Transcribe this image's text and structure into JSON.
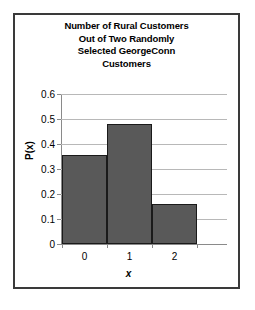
{
  "chart_data": {
    "type": "bar",
    "title": "Number of Rural Customers Out of Two Randomly Selected GeorgeConn Customers",
    "title_lines": [
      "Number of Rural Customers",
      "Out of Two Randomly",
      "Selected GeorgeConn",
      "Customers"
    ],
    "categories": [
      "0",
      "1",
      "2"
    ],
    "values": [
      0.355,
      0.48,
      0.16
    ],
    "xlabel": "x",
    "ylabel": "P(x)",
    "ylim": [
      0,
      0.6
    ],
    "yticks": [
      "0.6",
      "0.5",
      "0.4",
      "0.3",
      "0.2",
      "0.1",
      "0"
    ],
    "ytick_values": [
      0.6,
      0.5,
      0.4,
      0.3,
      0.2,
      0.1,
      0
    ],
    "grid": true,
    "legend": false,
    "bar_color": "#595959",
    "bar_border_color": "#1a1a1a",
    "gridline_color": "#b8b8b8",
    "axis_color": "#8a8a8a",
    "frame_color": "#3a3a3a",
    "background_color": "#ffffff"
  }
}
